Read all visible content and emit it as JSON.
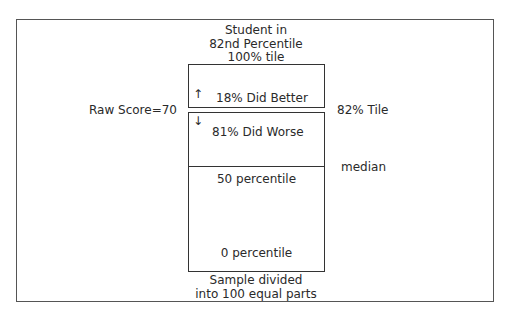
{
  "diagram": {
    "header": {
      "line1": "Student in",
      "line2": "82nd Percentile",
      "top_label": "100% tile"
    },
    "upper_box": {
      "label": "18% Did Better",
      "arrow": "up-arrow",
      "arrow_glyph": "↑"
    },
    "lower_box": {
      "label": "81% Did Worse",
      "arrow": "down-arrow",
      "arrow_glyph": "↓",
      "mid_label": "50 percentile",
      "bottom_label": "0 percentile"
    },
    "left_label": "Raw Score=70",
    "right_label": "82% Tile",
    "median_label": "median",
    "footer": {
      "line1": "Sample divided",
      "line2": "into 100 equal parts"
    }
  }
}
